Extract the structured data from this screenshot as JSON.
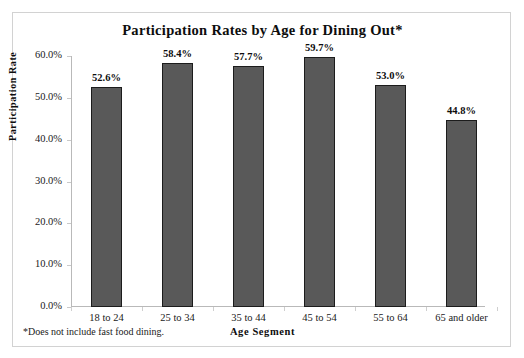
{
  "chart_data": {
    "type": "bar",
    "title": "Participation Rates by Age for Dining Out*",
    "xlabel": "Age  Segment",
    "ylabel": "Participation  Rate",
    "categories": [
      "18 to 24",
      "25 to 34",
      "35 to 44",
      "45 to 54",
      "55 to 64",
      "65 and older"
    ],
    "values": [
      52.6,
      58.4,
      57.7,
      59.7,
      53.0,
      44.8
    ],
    "data_labels": [
      "52.6%",
      "58.4%",
      "57.7%",
      "59.7%",
      "53.0%",
      "44.8%"
    ],
    "ylim": [
      0,
      60
    ],
    "ytick_values": [
      0,
      10,
      20,
      30,
      40,
      50,
      60
    ],
    "ytick_labels": [
      "0.0%",
      "10.0%",
      "20.0%",
      "30.0%",
      "40.0%",
      "50.0%",
      "60.0%"
    ],
    "grid": false,
    "legend": null,
    "bar_color": "#595959",
    "bar_border_color": "#1c1c1c",
    "axis_color": "#b9b9b9",
    "footnote": "*Does not include fast food dining."
  }
}
